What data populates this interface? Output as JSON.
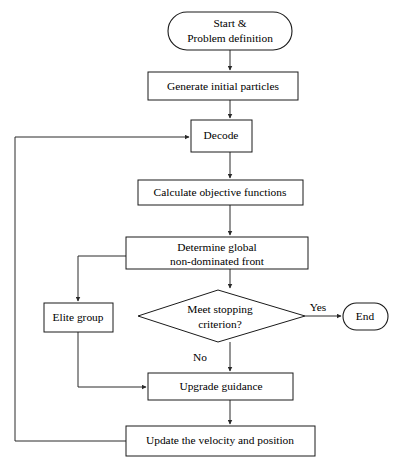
{
  "diagram": {
    "background_color": "#ffffff",
    "line_color": "#2a2a2a",
    "text_color": "#000000",
    "nodes": [
      {
        "id": "start",
        "shape": "terminator",
        "label_line1": "Start &",
        "label_line2": "Problem definition"
      },
      {
        "id": "generate",
        "shape": "process",
        "label": "Generate initial particles"
      },
      {
        "id": "decode",
        "shape": "process",
        "label": "Decode"
      },
      {
        "id": "calculate",
        "shape": "process",
        "label": "Calculate objective functions"
      },
      {
        "id": "determine",
        "shape": "process",
        "label_line1": "Determine global",
        "label_line2": "non-dominated front"
      },
      {
        "id": "decision",
        "shape": "decision",
        "label_line1": "Meet stopping",
        "label_line2": "criterion?"
      },
      {
        "id": "elite",
        "shape": "process",
        "label": "Elite group"
      },
      {
        "id": "end",
        "shape": "terminator",
        "label": "End"
      },
      {
        "id": "upgrade",
        "shape": "process",
        "label": "Upgrade guidance"
      },
      {
        "id": "update",
        "shape": "process",
        "label": "Update the velocity and position"
      }
    ],
    "edge_labels": {
      "yes": "Yes",
      "no": "No"
    }
  }
}
